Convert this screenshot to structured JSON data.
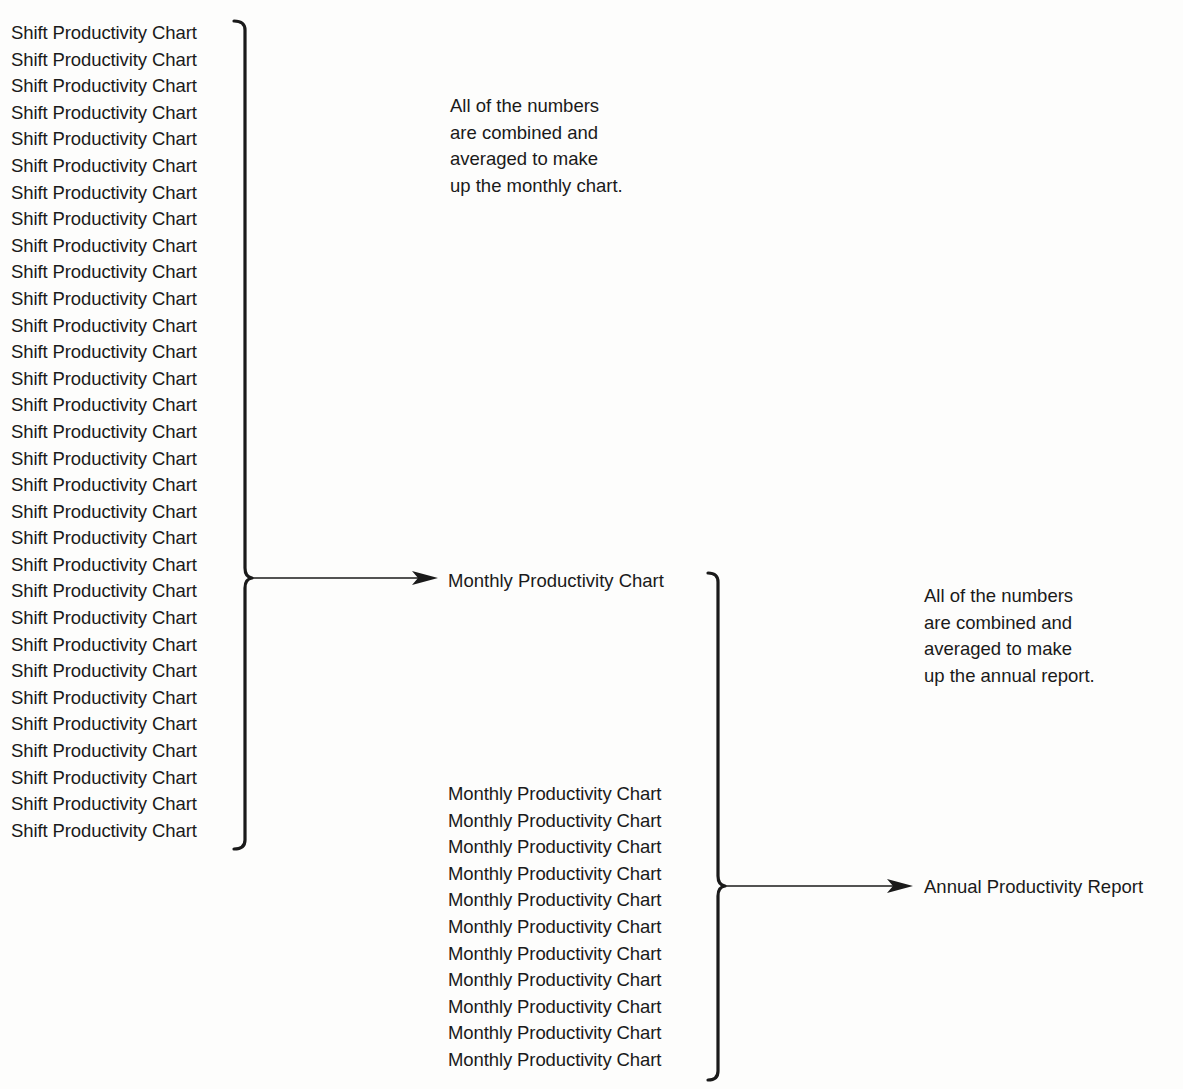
{
  "diagram": {
    "shift_charts": {
      "item_label": "Shift Productivity Chart",
      "count": 31,
      "items": [
        "Shift Productivity Chart",
        "Shift Productivity Chart",
        "Shift Productivity Chart",
        "Shift Productivity Chart",
        "Shift Productivity Chart",
        "Shift Productivity Chart",
        "Shift Productivity Chart",
        "Shift Productivity Chart",
        "Shift Productivity Chart",
        "Shift Productivity Chart",
        "Shift Productivity Chart",
        "Shift Productivity Chart",
        "Shift Productivity Chart",
        "Shift Productivity Chart",
        "Shift Productivity Chart",
        "Shift Productivity Chart",
        "Shift Productivity Chart",
        "Shift Productivity Chart",
        "Shift Productivity Chart",
        "Shift Productivity Chart",
        "Shift Productivity Chart",
        "Shift Productivity Chart",
        "Shift Productivity Chart",
        "Shift Productivity Chart",
        "Shift Productivity Chart",
        "Shift Productivity Chart",
        "Shift Productivity Chart",
        "Shift Productivity Chart",
        "Shift Productivity Chart",
        "Shift Productivity Chart",
        "Shift Productivity Chart"
      ]
    },
    "note_monthly": {
      "lines": [
        "All of the numbers",
        "are combined and",
        "averaged to make",
        "up the monthly chart."
      ]
    },
    "monthly_result": "Monthly Productivity Chart",
    "monthly_charts": {
      "item_label": "Monthly Productivity Chart",
      "count": 11,
      "items": [
        "Monthly Productivity Chart",
        "Monthly Productivity Chart",
        "Monthly Productivity Chart",
        "Monthly Productivity Chart",
        "Monthly Productivity Chart",
        "Monthly Productivity Chart",
        "Monthly Productivity Chart",
        "Monthly Productivity Chart",
        "Monthly Productivity Chart",
        "Monthly Productivity Chart",
        "Monthly Productivity Chart"
      ]
    },
    "note_annual": {
      "lines": [
        "All of the numbers",
        "are combined and",
        "averaged to make",
        "up the annual report."
      ]
    },
    "annual_result": "Annual Productivity Report",
    "connectors": [
      {
        "from": "shift_charts",
        "to": "monthly_result",
        "type": "brace-arrow"
      },
      {
        "from": "monthly_charts+monthly_result",
        "to": "annual_result",
        "type": "brace-arrow"
      }
    ],
    "colors": {
      "ink": "#1a1a1a",
      "background": "#fdfdfc"
    }
  }
}
